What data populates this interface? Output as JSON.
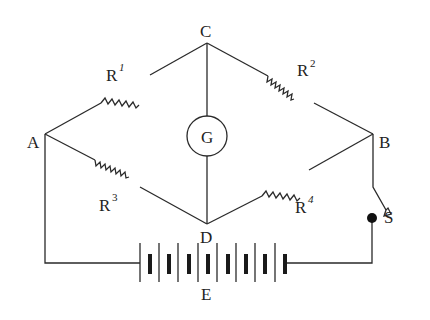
{
  "diagram": {
    "type": "circuit",
    "nodes": {
      "A": {
        "label": "A"
      },
      "B": {
        "label": "B"
      },
      "C": {
        "label": "C"
      },
      "D": {
        "label": "D"
      }
    },
    "resistors": [
      {
        "id": "R1",
        "base": "R",
        "sup": "1",
        "from": "A",
        "to": "C"
      },
      {
        "id": "R2",
        "base": "R",
        "sup": "2",
        "from": "C",
        "to": "B"
      },
      {
        "id": "R3",
        "base": "R",
        "sup": "3",
        "from": "A",
        "to": "D"
      },
      {
        "id": "R4",
        "base": "R",
        "sup": "4",
        "from": "D",
        "to": "B"
      }
    ],
    "galvanometer": {
      "label": "G",
      "from": "C",
      "to": "D"
    },
    "battery": {
      "label": "E",
      "cells": 8
    },
    "switch": {
      "label": "S",
      "state": "open"
    },
    "colors": {
      "line": "#2a2a2a",
      "text": "#222222",
      "background": "#ffffff"
    }
  }
}
